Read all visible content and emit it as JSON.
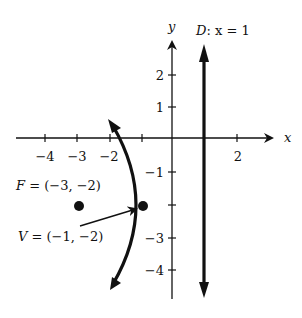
{
  "figure": {
    "type": "parabola-diagram",
    "axes": {
      "x_label": "x",
      "y_label": "y",
      "x_ticks": [
        {
          "value": -4,
          "label": "−4"
        },
        {
          "value": -3,
          "label": "−3"
        },
        {
          "value": -2,
          "label": "−2"
        },
        {
          "value": -1,
          "label": ""
        },
        {
          "value": 2,
          "label": "2"
        }
      ],
      "y_ticks": [
        {
          "value": 2,
          "label": "2"
        },
        {
          "value": 1,
          "label": "1"
        },
        {
          "value": -1,
          "label": "−1"
        },
        {
          "value": -2,
          "label": ""
        },
        {
          "value": -3,
          "label": "−3"
        },
        {
          "value": -4,
          "label": "−4"
        }
      ]
    },
    "directrix": {
      "label": "D: x = 1",
      "label_parts": {
        "name": "D",
        "rest": ": x = 1"
      },
      "x": 1
    },
    "focus": {
      "label": "F = (−3, −2)",
      "x": -3,
      "y": -2
    },
    "vertex": {
      "label": "V = (−1, −2)",
      "x": -1,
      "y": -2
    },
    "parabola": {
      "opens": "left",
      "equation_hint": "(y+2)^2 = -8(x+1)"
    },
    "colors": {
      "ink": "#111111",
      "background": "#ffffff"
    }
  }
}
